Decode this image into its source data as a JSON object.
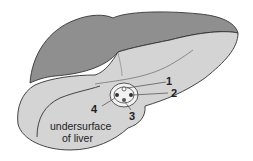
{
  "diagram": {
    "caption_lines": [
      "undersurface",
      "of liver"
    ],
    "labels": [
      {
        "id": "1",
        "text": "1"
      },
      {
        "id": "2",
        "text": "2"
      },
      {
        "id": "3",
        "text": "3"
      },
      {
        "id": "4",
        "text": "4"
      }
    ],
    "colors": {
      "upper_surface": "#8f8f8f",
      "under_surface": "#d4d4d4",
      "outline": "#333333",
      "porta": "#f2f2f2"
    }
  }
}
